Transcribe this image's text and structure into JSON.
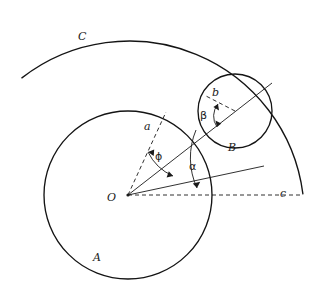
{
  "figure": {
    "kind": "geometry-diagram",
    "background_color": "#ffffff",
    "stroke_color": "#1a1a1a",
    "labels": {
      "circle_a": "A",
      "circle_b": "B",
      "arc_c": "C",
      "center_o": "O",
      "radius_a": "a",
      "radius_b": "b",
      "radius_c": "c",
      "angle_alpha": "α",
      "angle_beta": "β",
      "angle_phi": "ϕ"
    },
    "geometry": {
      "circle_a": {
        "cx": 128,
        "cy": 195,
        "r": 84
      },
      "circle_b": {
        "cx": 235,
        "cy": 111,
        "r": 37
      },
      "arc_c": {
        "cx": 128,
        "cy": 195,
        "r": 175,
        "start_deg": 138,
        "end_deg": 2
      },
      "center_point": {
        "x": 128,
        "y": 195
      },
      "ray_alpha_deg": 38,
      "ray_phi_deg": 63,
      "baseline_deg": 0,
      "beta_arc_deg": [
        128,
        212
      ]
    },
    "label_positions": {
      "circle_a": {
        "x": 93,
        "y": 252
      },
      "circle_b": {
        "x": 228,
        "y": 142
      },
      "arc_c": {
        "x": 78,
        "y": 31
      },
      "center_o": {
        "x": 107,
        "y": 192
      },
      "radius_a": {
        "x": 144,
        "y": 121
      },
      "radius_b": {
        "x": 212,
        "y": 87
      },
      "radius_c": {
        "x": 280,
        "y": 188
      },
      "angle_alpha": {
        "x": 189,
        "y": 161
      },
      "angle_beta": {
        "x": 200,
        "y": 110
      },
      "angle_phi": {
        "x": 155,
        "y": 151
      }
    }
  }
}
